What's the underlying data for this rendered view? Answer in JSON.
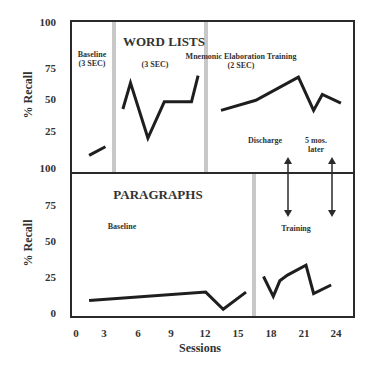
{
  "chart_data": [
    {
      "type": "line",
      "panel": "top",
      "title": "WORD LISTS",
      "xlabel": "Sessions",
      "ylabel": "% Recall",
      "ylim": [
        0,
        100
      ],
      "yticks": [
        "100",
        "75",
        "50",
        "25"
      ],
      "xlim": [
        0,
        24
      ],
      "phases": [
        {
          "label": "Baseline\n(3 SEC)",
          "label_lines": [
            "Baseline",
            "(3 SEC)"
          ]
        },
        {
          "label": "(3 SEC)",
          "label_lines": [
            "(3 SEC)"
          ]
        },
        {
          "label": "Mnemonic Elaboration Training (2 SEC)",
          "label_lines": [
            "Mnemonic Elaboration Training",
            "(2 SEC)"
          ]
        }
      ],
      "phase_dividers_x": [
        3.5,
        12
      ],
      "series": [
        {
          "name": "Baseline (3 SEC)",
          "x": [
            1.2,
            2.7
          ],
          "y": [
            8,
            14
          ]
        },
        {
          "name": "(3 SEC)",
          "x": [
            4.3,
            5.0,
            6.6,
            8.1,
            10.6,
            11.2
          ],
          "y": [
            40,
            58,
            20,
            45,
            45,
            63
          ]
        },
        {
          "name": "Mnemonic Elaboration Training (2 SEC)",
          "x": [
            13.3,
            16.5,
            20.4,
            21.8,
            22.6,
            24.3
          ],
          "y": [
            39,
            46,
            62,
            39,
            50,
            44
          ]
        }
      ],
      "annotations": [
        {
          "text": "Discharge",
          "x": 19.6
        },
        {
          "text": "5 mos. later",
          "lines": [
            "5 mos.",
            "later"
          ],
          "x": 23.6
        }
      ],
      "grid": false
    },
    {
      "type": "line",
      "panel": "bottom",
      "title": "PARAGRAPHS",
      "xlabel": "Sessions",
      "ylabel": "% Recall",
      "ylim": [
        0,
        100
      ],
      "yticks": [
        "100",
        "75",
        "50",
        "25",
        "0"
      ],
      "xticks": [
        "0",
        "3",
        "6",
        "9",
        "12",
        "15",
        "18",
        "21",
        "24"
      ],
      "xlim": [
        0,
        24
      ],
      "phases": [
        {
          "label": "Baseline"
        },
        {
          "label": "Training"
        }
      ],
      "phase_dividers_x": [
        16.4
      ],
      "series": [
        {
          "name": "Baseline",
          "x": [
            1.2,
            11.9,
            13.5,
            15.6
          ],
          "y": [
            8,
            14,
            2,
            14
          ]
        },
        {
          "name": "Training",
          "x": [
            17.2,
            18.1,
            18.7,
            19.4,
            21.1,
            21.8,
            23.4
          ],
          "y": [
            25,
            11,
            22,
            26,
            33,
            13,
            19
          ]
        }
      ],
      "grid": false
    }
  ],
  "labels": {
    "top_title": "WORD LISTS",
    "bottom_title": "PARAGRAPHS",
    "ylabel": "% Recall",
    "xlabel": "Sessions",
    "baseline_top_1": "Baseline",
    "baseline_top_2": "(3 SEC)",
    "phase2_top": "(3 SEC)",
    "phase3_top_1": "Mnemonic Elaboration Training",
    "phase3_top_2": "(2 SEC)",
    "discharge": "Discharge",
    "later_1": "5 mos.",
    "later_2": "later",
    "baseline_bottom": "Baseline",
    "training_bottom": "Training"
  },
  "colors": {
    "line": "#1e1e1e",
    "frame": "#2a2a2a",
    "divider": "#c8c8c8"
  }
}
